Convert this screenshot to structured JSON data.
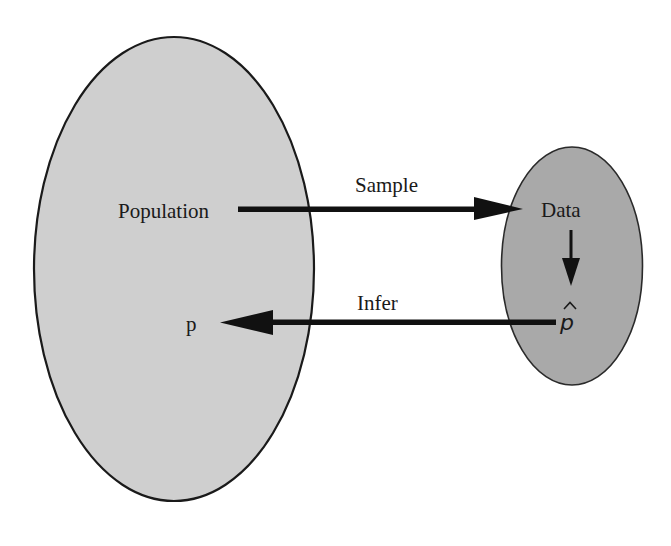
{
  "diagram": {
    "colors": {
      "population_fill": "#cfcfcf",
      "data_fill": "#a9a9a9",
      "stroke": "#1a1a1a",
      "arrow": "#111111",
      "background": "#ffffff"
    },
    "nodes": {
      "population": {
        "label": "Population",
        "shape": "ellipse",
        "cx": 174,
        "cy": 269,
        "rx": 140,
        "ry": 232
      },
      "data": {
        "label": "Data",
        "shape": "ellipse",
        "cx": 572,
        "cy": 266,
        "rx": 70,
        "ry": 119
      },
      "parameter": {
        "label": "p"
      },
      "statistic": {
        "label": "p",
        "accent": "hat"
      }
    },
    "edges": {
      "sample": {
        "label": "Sample",
        "from": "population",
        "to": "data",
        "direction": "right"
      },
      "compute": {
        "label": "",
        "from": "data",
        "to": "statistic",
        "direction": "down"
      },
      "infer": {
        "label": "Infer",
        "from": "statistic",
        "to": "parameter",
        "direction": "left"
      }
    }
  }
}
